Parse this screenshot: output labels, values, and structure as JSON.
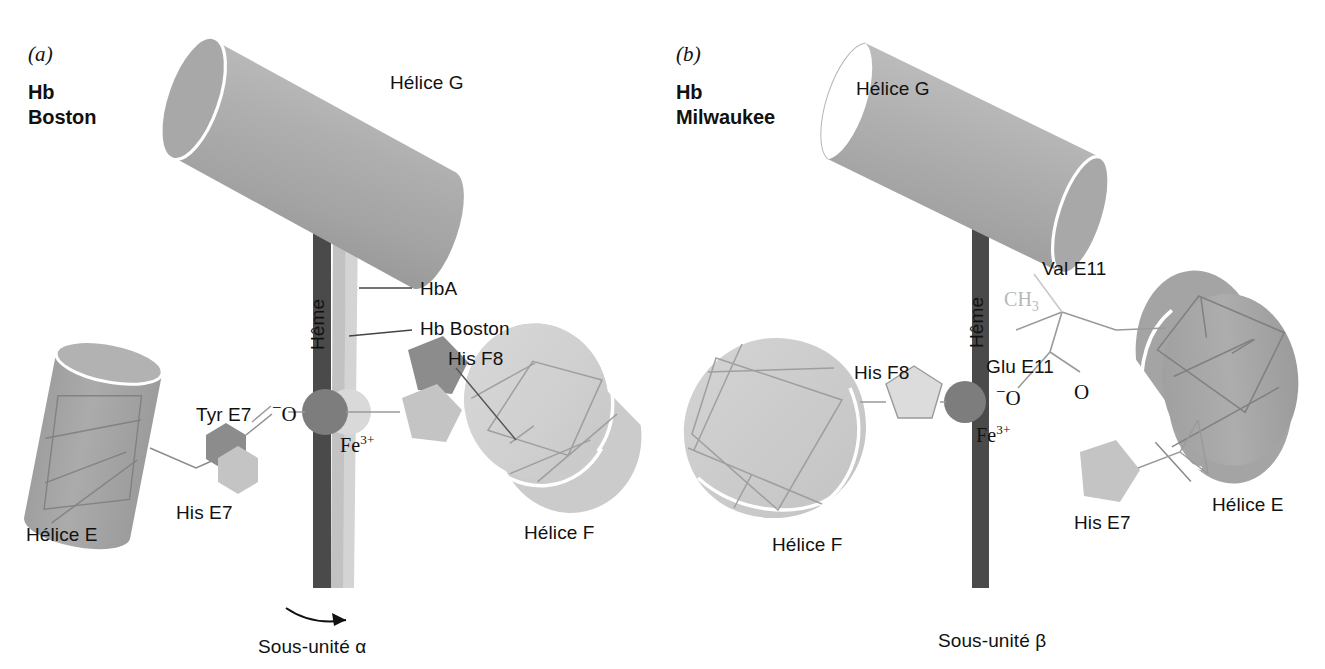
{
  "figure": {
    "colors": {
      "helix_gray": "#a9a9a9",
      "helix_light": "#d2d2d2",
      "heme_dark": "#4a4a4a",
      "heme_light": "#c9c9c9",
      "heme_mid": "#dedede",
      "residue_dark": "#8c8c8c",
      "residue_light": "#c4c4c4",
      "iron_dark": "#7d7d7d",
      "iron_light": "#d9d9d9",
      "outline": "#8a8a8a",
      "text": "#111111",
      "faint_text": "#b7b7b7",
      "background": "#ffffff"
    }
  },
  "panel_a": {
    "panel_letter": "(a)",
    "variant_name": "Hb\nBoston",
    "labels": {
      "helix_g": "Hélice G",
      "helix_e": "Hélice E",
      "helix_f": "Hélice F",
      "heme": "Hême",
      "hba": "HbA",
      "hb_boston": "Hb Boston",
      "his_f8": "His F8",
      "tyr_e7": "Tyr E7",
      "his_e7": "His E7",
      "oxygen": "⁻O",
      "iron": "Fe",
      "iron_charge": "3+",
      "subunit": "Sous-unité α"
    }
  },
  "panel_b": {
    "panel_letter": "(b)",
    "variant_name": "Hb\nMilwaukee",
    "labels": {
      "helix_g": "Hélice G",
      "helix_e": "Hélice E",
      "helix_f": "Hélice F",
      "heme": "Hême",
      "his_f8": "His F8",
      "his_e7": "His E7",
      "val_e11": "Val E11",
      "glu_e11": "Glu E11",
      "methyl": "CH",
      "methyl_sub": "3",
      "oxygen_anion": "⁻O",
      "oxygen": "O",
      "iron": "Fe",
      "iron_charge": "3+",
      "subunit": "Sous-unité β"
    }
  }
}
